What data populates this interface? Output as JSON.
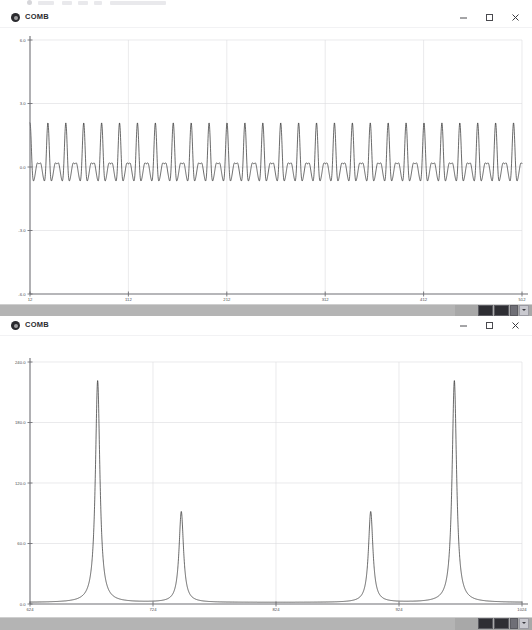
{
  "app": {
    "window_title": "COMB",
    "icon": "app-circle-icon"
  },
  "window_controls": {
    "minimize": "minimize-icon",
    "maximize": "maximize-icon",
    "close": "close-icon"
  },
  "scrollbar": {
    "mini_buttons": [
      "toolbar-button-1",
      "toolbar-button-2",
      "toolbar-button-3",
      "toolbar-dropdown"
    ]
  },
  "windows": [
    {
      "title": "COMB",
      "plot": "time-domain-comb-signal"
    },
    {
      "title": "COMB",
      "plot": "frequency-domain-comb-spectrum"
    }
  ],
  "chart_data": [
    {
      "type": "line",
      "title": "COMB",
      "plot_id": "time-domain",
      "xlabel": "",
      "ylabel": "",
      "grid": true,
      "legend": "none",
      "xlim": [
        12,
        512
      ],
      "ylim": [
        -6.0,
        6.0
      ],
      "xticks": [
        12,
        112,
        212,
        312,
        412,
        512
      ],
      "xtick_labels": [
        "12",
        "112",
        "212",
        "312",
        "412",
        "512"
      ],
      "yticks": [
        -6.0,
        -3.0,
        0.0,
        3.0,
        6.0
      ],
      "ytick_labels": [
        "-6.0",
        "-3.0",
        "0.0",
        "3.0",
        "6.0"
      ],
      "description": "Amplitude-modulated comb waveform: fast carrier oscillation inside a slow beat envelope, oscillating about 0.0 between about -3.0 and +3.2.",
      "series": [
        {
          "name": "comb signal",
          "color": "#1a1a1a",
          "model": {
            "kind": "beat_carrier",
            "carrier_period": 9.1,
            "envelope_period": 18.2,
            "base_amplitude": 1.05,
            "envelope_depth": 1.0,
            "offset": 0.15
          }
        }
      ]
    },
    {
      "type": "line",
      "title": "COMB",
      "plot_id": "frequency-domain",
      "xlabel": "",
      "ylabel": "",
      "grid": true,
      "legend": "none",
      "xlim": [
        624,
        1024
      ],
      "ylim": [
        0.0,
        240.0
      ],
      "xticks": [
        624,
        724,
        824,
        924,
        1024
      ],
      "xtick_labels": [
        "624",
        "724",
        "824",
        "924",
        "1024"
      ],
      "yticks": [
        0.0,
        60.0,
        120.0,
        180.0,
        240.0
      ],
      "ytick_labels": [
        "0.0",
        "60.0",
        "120.0",
        "180.0",
        "240.0"
      ],
      "description": "Magnitude spectrum with four narrow Lorentzian peaks, symmetric pair heights 220 and 90.",
      "peaks": [
        {
          "x": 679,
          "height": 220.0,
          "width": 2.2
        },
        {
          "x": 747,
          "height": 90.0,
          "width": 2.2
        },
        {
          "x": 901,
          "height": 90.0,
          "width": 2.2
        },
        {
          "x": 969,
          "height": 220.0,
          "width": 2.2
        }
      ],
      "baseline": 1.5,
      "series": [
        {
          "name": "comb spectrum",
          "color": "#1a1a1a"
        }
      ]
    }
  ]
}
